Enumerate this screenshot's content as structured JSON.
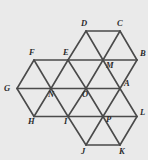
{
  "figure": {
    "background_color": "#eaeaea",
    "line_color": "#4a4a4a",
    "label_color": "#2b2b2b",
    "canvas": {
      "width": 148,
      "height": 160
    },
    "geometry": {
      "column_spacing_px": 34,
      "half_column_spacing_px": 17,
      "row_spacing_px": 28.5,
      "rows_y": [
        31,
        60,
        88.5,
        116.5,
        145
      ],
      "columns_x": [
        17,
        34,
        51,
        68,
        86,
        103,
        120,
        137
      ]
    },
    "vertices": [
      {
        "id": "D",
        "label": "D",
        "x": 86,
        "y": 31,
        "label_x": 81,
        "label_y": 26
      },
      {
        "id": "C",
        "label": "C",
        "x": 120,
        "y": 31,
        "label_x": 117,
        "label_y": 26
      },
      {
        "id": "F",
        "label": "F",
        "x": 34,
        "y": 60,
        "label_x": 29,
        "label_y": 55
      },
      {
        "id": "E",
        "label": "E",
        "x": 68,
        "y": 60,
        "label_x": 63,
        "label_y": 55
      },
      {
        "id": "M",
        "label": "M",
        "x": 103,
        "y": 60,
        "label_x": 106,
        "label_y": 68
      },
      {
        "id": "B",
        "label": "B",
        "x": 137,
        "y": 60,
        "label_x": 140,
        "label_y": 56
      },
      {
        "id": "G",
        "label": "G",
        "x": 17,
        "y": 88.5,
        "label_x": 4,
        "label_y": 91
      },
      {
        "id": "N",
        "label": "N",
        "x": 51,
        "y": 88.5,
        "label_x": 48,
        "label_y": 97
      },
      {
        "id": "O",
        "label": "O",
        "x": 86,
        "y": 88.5,
        "label_x": 82,
        "label_y": 97
      },
      {
        "id": "A",
        "label": "A",
        "x": 120,
        "y": 88.5,
        "label_x": 124,
        "label_y": 86
      },
      {
        "id": "H",
        "label": "H",
        "x": 34,
        "y": 116.5,
        "label_x": 28,
        "label_y": 124
      },
      {
        "id": "I",
        "label": "I",
        "x": 68,
        "y": 116.5,
        "label_x": 64,
        "label_y": 124
      },
      {
        "id": "P",
        "label": "P",
        "x": 103,
        "y": 116.5,
        "label_x": 106,
        "label_y": 122
      },
      {
        "id": "L",
        "label": "L",
        "x": 137,
        "y": 116.5,
        "label_x": 140,
        "label_y": 115
      },
      {
        "id": "J",
        "label": "J",
        "x": 86,
        "y": 145,
        "label_x": 81,
        "label_y": 154
      },
      {
        "id": "K",
        "label": "K",
        "x": 120,
        "y": 145,
        "label_x": 119,
        "label_y": 154
      }
    ],
    "edges": [
      {
        "from": "D",
        "to": "C",
        "x1": 86,
        "y1": 31,
        "x2": 120,
        "y2": 31
      },
      {
        "from": "F",
        "to": "E",
        "x1": 34,
        "y1": 60,
        "x2": 68,
        "y2": 60
      },
      {
        "from": "E",
        "to": "M",
        "x1": 68,
        "y1": 60,
        "x2": 103,
        "y2": 60
      },
      {
        "from": "M",
        "to": "B",
        "x1": 103,
        "y1": 60,
        "x2": 137,
        "y2": 60
      },
      {
        "from": "G",
        "to": "N",
        "x1": 17,
        "y1": 88.5,
        "x2": 51,
        "y2": 88.5
      },
      {
        "from": "N",
        "to": "O",
        "x1": 51,
        "y1": 88.5,
        "x2": 86,
        "y2": 88.5
      },
      {
        "from": "O",
        "to": "A",
        "x1": 86,
        "y1": 88.5,
        "x2": 120,
        "y2": 88.5
      },
      {
        "from": "H",
        "to": "I",
        "x1": 34,
        "y1": 116.5,
        "x2": 68,
        "y2": 116.5
      },
      {
        "from": "I",
        "to": "P",
        "x1": 68,
        "y1": 116.5,
        "x2": 103,
        "y2": 116.5
      },
      {
        "from": "P",
        "to": "L",
        "x1": 103,
        "y1": 116.5,
        "x2": 137,
        "y2": 116.5
      },
      {
        "from": "J",
        "to": "K",
        "x1": 86,
        "y1": 145,
        "x2": 120,
        "y2": 145
      },
      {
        "from": "D",
        "to": "E",
        "x1": 86,
        "y1": 31,
        "x2": 68,
        "y2": 60
      },
      {
        "from": "D",
        "to": "M",
        "x1": 86,
        "y1": 31,
        "x2": 103,
        "y2": 60
      },
      {
        "from": "C",
        "to": "M",
        "x1": 120,
        "y1": 31,
        "x2": 103,
        "y2": 60
      },
      {
        "from": "C",
        "to": "B",
        "x1": 120,
        "y1": 31,
        "x2": 137,
        "y2": 60
      },
      {
        "from": "F",
        "to": "G",
        "x1": 34,
        "y1": 60,
        "x2": 17,
        "y2": 88.5
      },
      {
        "from": "F",
        "to": "N",
        "x1": 34,
        "y1": 60,
        "x2": 51,
        "y2": 88.5
      },
      {
        "from": "E",
        "to": "N",
        "x1": 68,
        "y1": 60,
        "x2": 51,
        "y2": 88.5
      },
      {
        "from": "E",
        "to": "O",
        "x1": 68,
        "y1": 60,
        "x2": 86,
        "y2": 88.5
      },
      {
        "from": "M",
        "to": "O",
        "x1": 103,
        "y1": 60,
        "x2": 86,
        "y2": 88.5
      },
      {
        "from": "M",
        "to": "A",
        "x1": 103,
        "y1": 60,
        "x2": 120,
        "y2": 88.5
      },
      {
        "from": "B",
        "to": "A",
        "x1": 137,
        "y1": 60,
        "x2": 120,
        "y2": 88.5
      },
      {
        "from": "G",
        "to": "H",
        "x1": 17,
        "y1": 88.5,
        "x2": 34,
        "y2": 116.5
      },
      {
        "from": "N",
        "to": "H",
        "x1": 51,
        "y1": 88.5,
        "x2": 34,
        "y2": 116.5
      },
      {
        "from": "N",
        "to": "I",
        "x1": 51,
        "y1": 88.5,
        "x2": 68,
        "y2": 116.5
      },
      {
        "from": "O",
        "to": "I",
        "x1": 86,
        "y1": 88.5,
        "x2": 68,
        "y2": 116.5
      },
      {
        "from": "O",
        "to": "P",
        "x1": 86,
        "y1": 88.5,
        "x2": 103,
        "y2": 116.5
      },
      {
        "from": "A",
        "to": "P",
        "x1": 120,
        "y1": 88.5,
        "x2": 103,
        "y2": 116.5
      },
      {
        "from": "A",
        "to": "L",
        "x1": 120,
        "y1": 88.5,
        "x2": 137,
        "y2": 116.5
      },
      {
        "from": "I",
        "to": "J",
        "x1": 68,
        "y1": 116.5,
        "x2": 86,
        "y2": 145
      },
      {
        "from": "P",
        "to": "J",
        "x1": 103,
        "y1": 116.5,
        "x2": 86,
        "y2": 145
      },
      {
        "from": "P",
        "to": "K",
        "x1": 103,
        "y1": 116.5,
        "x2": 120,
        "y2": 145
      },
      {
        "from": "L",
        "to": "K",
        "x1": 137,
        "y1": 116.5,
        "x2": 120,
        "y2": 145
      }
    ]
  }
}
